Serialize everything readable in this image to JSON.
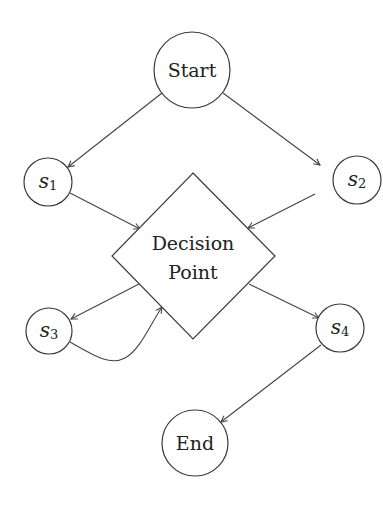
{
  "diagram": {
    "type": "flowchart",
    "nodes": [
      {
        "id": "start",
        "shape": "circle",
        "label": "Start",
        "cx": 192,
        "cy": 70,
        "r": 38
      },
      {
        "id": "s1",
        "shape": "circle",
        "label_base": "s",
        "label_sub": "1",
        "cx": 48,
        "cy": 182,
        "r": 24
      },
      {
        "id": "s2",
        "shape": "circle",
        "label_base": "s",
        "label_sub": "2",
        "cx": 357,
        "cy": 180,
        "r": 24
      },
      {
        "id": "decision",
        "shape": "diamond",
        "label_line1": "Decision",
        "label_line2": "Point",
        "cx": 193,
        "cy": 256,
        "hw": 81,
        "hh": 83
      },
      {
        "id": "s3",
        "shape": "circle",
        "label_base": "s",
        "label_sub": "3",
        "cx": 49,
        "cy": 331,
        "r": 23
      },
      {
        "id": "s4",
        "shape": "circle",
        "label_base": "s",
        "label_sub": "4",
        "cx": 340,
        "cy": 328,
        "r": 24
      },
      {
        "id": "end",
        "shape": "circle",
        "label": "End",
        "cx": 195,
        "cy": 443,
        "r": 33
      }
    ],
    "edges": [
      {
        "from": "start",
        "to": "s1"
      },
      {
        "from": "start",
        "to": "s2"
      },
      {
        "from": "s1",
        "to": "decision"
      },
      {
        "from": "s2",
        "to": "decision"
      },
      {
        "from": "decision",
        "to": "s3"
      },
      {
        "from": "s3",
        "to": "decision",
        "curved": true
      },
      {
        "from": "decision",
        "to": "s4"
      },
      {
        "from": "s4",
        "to": "end"
      }
    ],
    "colors": {
      "stroke": "#3a3a3a",
      "background": "#ffffff",
      "text": "#222222"
    }
  }
}
